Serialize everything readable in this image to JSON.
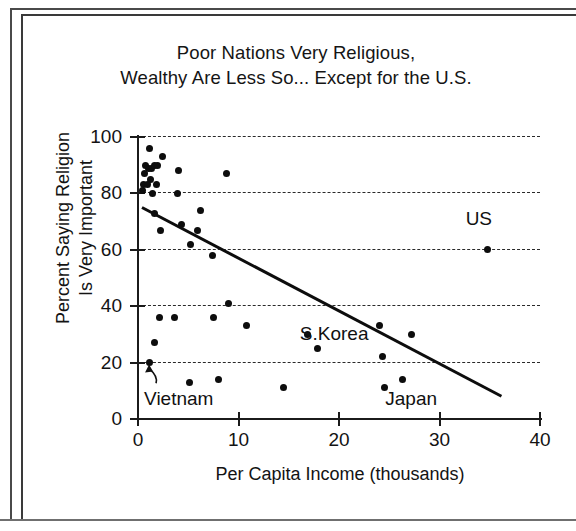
{
  "chart_data": {
    "type": "scatter",
    "title": "Poor Nations Very Religious, Wealthy Are Less So... Except for the U.S.",
    "title_lines": [
      "Poor Nations Very Religious,",
      "Wealthy Are Less So... Except for the U.S."
    ],
    "xlabel": "Per Capita Income (thousands)",
    "ylabel": "Percent Saying Religion Is Very Important",
    "ylabel_lines": [
      "Percent Saying Religion",
      "Is Very Important"
    ],
    "xlim": [
      0,
      40
    ],
    "ylim": [
      0,
      100
    ],
    "xticks": [
      0,
      10,
      20,
      30,
      40
    ],
    "yticks": [
      0,
      20,
      40,
      60,
      80,
      100
    ],
    "xtick_labels": [
      "0",
      "10",
      "20",
      "30",
      "40"
    ],
    "ytick_labels": [
      "0",
      "20",
      "40",
      "60",
      "80",
      "100"
    ],
    "grid": "horizontal-dashed",
    "legend": "none",
    "series": [
      {
        "name": "Nations",
        "marker": "filled-circle",
        "color": "#0d0d0d",
        "points": [
          {
            "x": 1.1,
            "y": 96
          },
          {
            "x": 2.4,
            "y": 93
          },
          {
            "x": 0.7,
            "y": 90
          },
          {
            "x": 1.0,
            "y": 89
          },
          {
            "x": 1.3,
            "y": 89
          },
          {
            "x": 1.6,
            "y": 90
          },
          {
            "x": 1.9,
            "y": 90
          },
          {
            "x": 0.6,
            "y": 87
          },
          {
            "x": 1.2,
            "y": 85
          },
          {
            "x": 4.0,
            "y": 88
          },
          {
            "x": 8.8,
            "y": 87
          },
          {
            "x": 0.5,
            "y": 83
          },
          {
            "x": 0.9,
            "y": 83
          },
          {
            "x": 1.8,
            "y": 83
          },
          {
            "x": 0.4,
            "y": 81
          },
          {
            "x": 1.4,
            "y": 80
          },
          {
            "x": 3.9,
            "y": 80
          },
          {
            "x": 6.2,
            "y": 74
          },
          {
            "x": 1.6,
            "y": 73
          },
          {
            "x": 4.3,
            "y": 69
          },
          {
            "x": 2.2,
            "y": 67
          },
          {
            "x": 5.9,
            "y": 67
          },
          {
            "x": 5.2,
            "y": 62
          },
          {
            "x": 7.4,
            "y": 58
          },
          {
            "x": 34.8,
            "y": 60
          },
          {
            "x": 9.0,
            "y": 41
          },
          {
            "x": 2.1,
            "y": 36
          },
          {
            "x": 3.6,
            "y": 36
          },
          {
            "x": 7.5,
            "y": 36
          },
          {
            "x": 10.8,
            "y": 33
          },
          {
            "x": 24.0,
            "y": 33
          },
          {
            "x": 27.2,
            "y": 30
          },
          {
            "x": 16.9,
            "y": 30
          },
          {
            "x": 1.6,
            "y": 27
          },
          {
            "x": 17.9,
            "y": 25
          },
          {
            "x": 24.3,
            "y": 22
          },
          {
            "x": 1.1,
            "y": 20
          },
          {
            "x": 5.1,
            "y": 13
          },
          {
            "x": 8.0,
            "y": 14
          },
          {
            "x": 14.5,
            "y": 11
          },
          {
            "x": 24.5,
            "y": 11
          },
          {
            "x": 26.3,
            "y": 14
          }
        ]
      }
    ],
    "trend_line": {
      "style": "solid",
      "color": "#0d0d0d",
      "start": {
        "x": 0.4,
        "y": 75
      },
      "end": {
        "x": 36.2,
        "y": 8
      }
    },
    "annotations": [
      {
        "label": "US",
        "x": 34.8,
        "y": 60,
        "text_x": 33.0,
        "text_y": 71,
        "arrow": false
      },
      {
        "label": "S.Korea",
        "x": 17.0,
        "y": 30,
        "text_x": 16.5,
        "text_y": 30,
        "arrow": false
      },
      {
        "label": "Vietnam",
        "x": 1.1,
        "y": 20,
        "text_x": 1.0,
        "text_y": 7,
        "arrow": true
      },
      {
        "label": "Japan",
        "x": 26.3,
        "y": 14,
        "text_x": 25.0,
        "text_y": 7,
        "arrow": false
      }
    ]
  }
}
